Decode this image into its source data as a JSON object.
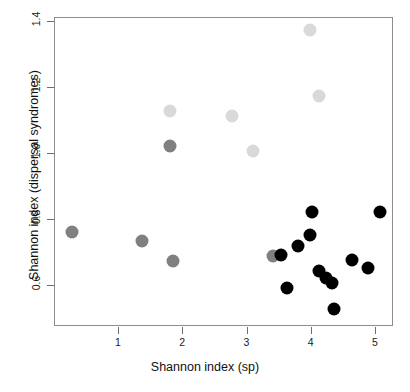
{
  "chart_data": {
    "type": "scatter",
    "title": "",
    "xlabel": "Shannon index (sp)",
    "ylabel": "Shannon index (dispersal syndromes)",
    "xlim": [
      0.08,
      5.28
    ],
    "ylim": [
      0.51,
      1.42
    ],
    "xticks": [
      1,
      2,
      3,
      4,
      5
    ],
    "yticks": [
      0.6,
      0.8,
      1.0,
      1.2,
      1.4
    ],
    "xtick_labels": [
      "1",
      "2",
      "3",
      "4",
      "5"
    ],
    "ytick_labels": [
      "0.6",
      "0.8",
      "1.0",
      "1.2",
      "1.4"
    ],
    "grid": false,
    "legend": false,
    "legend_position": "none",
    "point_shape": "filled-circle",
    "point_size_px": 13,
    "colors": {
      "light_gray": "#d9d9d9",
      "medium_gray": "#808080",
      "black": "#000000",
      "frame": "#8e8e8e",
      "tick": "#6e6e6e",
      "text": "#111111",
      "background": "#ffffff"
    },
    "series": [
      {
        "name": "light-gray-group",
        "color": "#d9d9d9",
        "points": [
          {
            "x": 3.97,
            "y": 1.375
          },
          {
            "x": 4.12,
            "y": 1.175
          },
          {
            "x": 1.79,
            "y": 1.13
          },
          {
            "x": 2.76,
            "y": 1.115
          },
          {
            "x": 3.09,
            "y": 1.01
          }
        ]
      },
      {
        "name": "medium-gray-group",
        "color": "#808080",
        "points": [
          {
            "x": 1.79,
            "y": 1.025
          },
          {
            "x": 0.27,
            "y": 0.765
          },
          {
            "x": 1.36,
            "y": 0.735
          },
          {
            "x": 1.84,
            "y": 0.675
          },
          {
            "x": 3.39,
            "y": 0.69
          }
        ]
      },
      {
        "name": "black-group",
        "color": "#000000",
        "points": [
          {
            "x": 4.0,
            "y": 0.825
          },
          {
            "x": 5.06,
            "y": 0.825
          },
          {
            "x": 3.97,
            "y": 0.755
          },
          {
            "x": 3.79,
            "y": 0.72
          },
          {
            "x": 3.52,
            "y": 0.695
          },
          {
            "x": 4.63,
            "y": 0.68
          },
          {
            "x": 4.88,
            "y": 0.655
          },
          {
            "x": 4.12,
            "y": 0.645
          },
          {
            "x": 4.22,
            "y": 0.625
          },
          {
            "x": 4.31,
            "y": 0.61
          },
          {
            "x": 3.61,
            "y": 0.595
          },
          {
            "x": 4.35,
            "y": 0.53
          }
        ]
      }
    ]
  },
  "axis": {
    "x_title": "Shannon index (sp)",
    "y_title": "Shannon index (dispersal syndromes)"
  }
}
